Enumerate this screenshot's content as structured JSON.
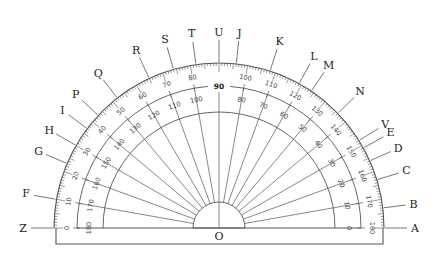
{
  "diagram": {
    "title": "Protractor with labeled rays",
    "center_label": "O",
    "colors": {
      "line": "#555555",
      "text": "#222222",
      "tick": "#555555",
      "background": "#ffffff"
    },
    "geometry": {
      "center": [
        219,
        228
      ],
      "r_outer": 165,
      "r_mid": 142,
      "r_inner": 116,
      "r_small": 26,
      "base_bottom": 244,
      "base_left": 56,
      "base_right": 383,
      "ray_label_radius_end": 196
    },
    "outer_scale": {
      "description": "Outer numbers increase left to right (0 at left, 180 at right)",
      "labels": [
        "0",
        "10",
        "20",
        "30",
        "40",
        "50",
        "60",
        "70",
        "80",
        "90",
        "100",
        "110",
        "120",
        "130",
        "140",
        "150",
        "160",
        "170",
        "180"
      ]
    },
    "inner_scale": {
      "description": "Inner numbers increase right to left (0 at right, 180 at left)",
      "labels": [
        "180",
        "170",
        "160",
        "150",
        "140",
        "130",
        "120",
        "110",
        "100",
        "90",
        "80",
        "70",
        "60",
        "50",
        "40",
        "30",
        "20",
        "10",
        "0"
      ]
    },
    "rays": [
      {
        "label": "A",
        "angle": 0
      },
      {
        "label": "B",
        "angle": 7
      },
      {
        "label": "C",
        "angle": 17
      },
      {
        "label": "D",
        "angle": 24
      },
      {
        "label": "E",
        "angle": 29
      },
      {
        "label": "V",
        "angle": 32
      },
      {
        "label": "N",
        "angle": 44
      },
      {
        "label": "M",
        "angle": 56
      },
      {
        "label": "L",
        "angle": 61
      },
      {
        "label": "K",
        "angle": 72
      },
      {
        "label": "J",
        "angle": 84
      },
      {
        "label": "U",
        "angle": 90
      },
      {
        "label": "T",
        "angle": 98
      },
      {
        "label": "S",
        "angle": 106
      },
      {
        "label": "R",
        "angle": 115
      },
      {
        "label": "Q",
        "angle": 128
      },
      {
        "label": "P",
        "angle": 137
      },
      {
        "label": "I",
        "angle": 143
      },
      {
        "label": "H",
        "angle": 150
      },
      {
        "label": "G",
        "angle": 157
      },
      {
        "label": "F",
        "angle": 170
      },
      {
        "label": "Z",
        "angle": 180
      }
    ]
  }
}
